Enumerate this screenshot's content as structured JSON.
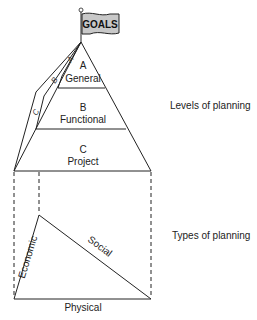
{
  "flag": {
    "label": "GOALS"
  },
  "pyramid": {
    "levels": [
      {
        "letter": "A",
        "name": "General"
      },
      {
        "letter": "B",
        "name": "Functional"
      },
      {
        "letter": "C",
        "name": "Project"
      }
    ],
    "side_face_letters": [
      "A",
      "B",
      "C"
    ]
  },
  "types_triangle": {
    "sides": {
      "left": "Economic",
      "right": "Social",
      "bottom": "Physical"
    }
  },
  "annotations": {
    "levels_label": "Levels of planning",
    "types_label": "Types of planning"
  },
  "colors": {
    "line": "#222222",
    "flag_fill": "#c8c8c8"
  }
}
